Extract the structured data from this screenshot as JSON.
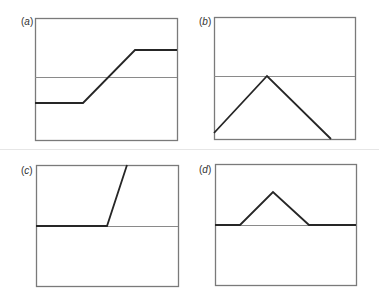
{
  "figure": {
    "colors": {
      "frame": "#7a7a7a",
      "reference_line": "#8a8a8a",
      "curve": "#262626",
      "background": "#ffffff",
      "divider": "#e6e6e6"
    }
  },
  "panels": [
    {
      "id": "a",
      "label_open": "(",
      "label_letter": "a",
      "label_close": ")",
      "label_pos": [
        21,
        17
      ],
      "box": {
        "x": 35,
        "y": 18,
        "w": 142,
        "h": 122
      },
      "reference_y": 77,
      "curve_points": [
        [
          35,
          103
        ],
        [
          83,
          103
        ],
        [
          135,
          50
        ],
        [
          177,
          50
        ]
      ],
      "shape": "ramp-up"
    },
    {
      "id": "b",
      "label_open": "(",
      "label_letter": "b",
      "label_close": ")",
      "label_pos": [
        199,
        17
      ],
      "box": {
        "x": 214,
        "y": 17,
        "w": 141,
        "h": 122
      },
      "reference_y": 76,
      "curve_points": [
        [
          214,
          133
        ],
        [
          267,
          76
        ],
        [
          331,
          139
        ]
      ],
      "shape": "triangle-peak-at-reference"
    },
    {
      "id": "c",
      "label_open": "(",
      "label_letter": "c",
      "label_close": ")",
      "label_pos": [
        21,
        166
      ],
      "box": {
        "x": 36,
        "y": 165,
        "w": 142,
        "h": 121
      },
      "reference_y": 226,
      "curve_points": [
        [
          36,
          226
        ],
        [
          107,
          226
        ],
        [
          127,
          165
        ]
      ],
      "shape": "flat-then-steep-rise"
    },
    {
      "id": "d",
      "label_open": "(",
      "label_letter": "d",
      "label_close": ")",
      "label_pos": [
        199,
        165
      ],
      "box": {
        "x": 215,
        "y": 164,
        "w": 141,
        "h": 121
      },
      "reference_y": 225,
      "curve_points": [
        [
          215,
          225
        ],
        [
          240,
          225
        ],
        [
          273,
          192
        ],
        [
          309,
          225
        ],
        [
          356,
          225
        ]
      ],
      "shape": "triangle-bump-above-reference"
    }
  ],
  "divider_y": 149
}
